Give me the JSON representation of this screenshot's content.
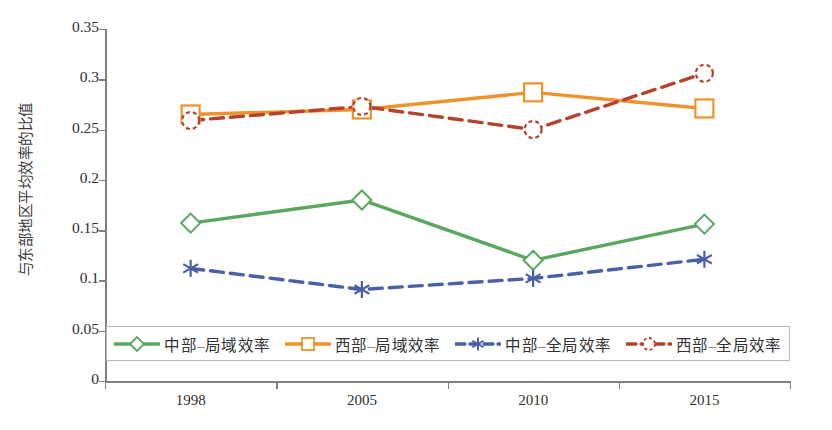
{
  "chart_data": {
    "type": "line",
    "title": "",
    "xlabel": "",
    "ylabel": "与东部地区平均效率的比值",
    "categories": [
      "1998",
      "2005",
      "2010",
      "2015"
    ],
    "ylim": [
      0,
      0.35
    ],
    "yticks": [
      "0",
      "0.05",
      "0.1",
      "0.15",
      "0.2",
      "0.25",
      "0.3",
      "0.35"
    ],
    "ytick_values": [
      0,
      0.05,
      0.1,
      0.15,
      0.2,
      0.25,
      0.3,
      0.35
    ],
    "grid": false,
    "legend_position": "inside-bottom",
    "series": [
      {
        "name": "中部–局域效率",
        "values": [
          0.157,
          0.18,
          0.12,
          0.156
        ],
        "color": "#5aa860",
        "marker": "diamond",
        "linestyle": "solid"
      },
      {
        "name": "西部–局域效率",
        "values": [
          0.265,
          0.27,
          0.287,
          0.271
        ],
        "color": "#f0922b",
        "marker": "square",
        "linestyle": "solid"
      },
      {
        "name": "中部–全局效率",
        "values": [
          0.112,
          0.091,
          0.102,
          0.121
        ],
        "color": "#4a5fa5",
        "marker": "asterisk",
        "linestyle": "dashed"
      },
      {
        "name": "西部–全局效率",
        "values": [
          0.259,
          0.273,
          0.25,
          0.306
        ],
        "color": "#b5422c",
        "marker": "circle",
        "linestyle": "dashed"
      }
    ]
  },
  "axis": {
    "y_title": "与东部地区平均效率的比值"
  },
  "legend": {
    "items": [
      {
        "label": "中部–局域效率"
      },
      {
        "label": "西部–局域效率"
      },
      {
        "label": "中部–全局效率"
      },
      {
        "label": "西部–全局效率"
      }
    ]
  }
}
